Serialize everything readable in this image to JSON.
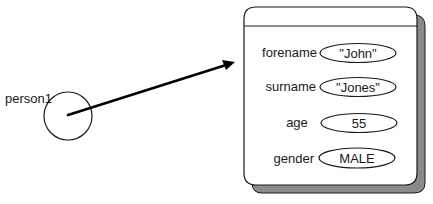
{
  "diagram": {
    "reference": {
      "label": "person1"
    },
    "object": {
      "fields": [
        {
          "name": "forename",
          "value": "\"John\""
        },
        {
          "name": "surname",
          "value": "\"Jones\""
        },
        {
          "name": "age",
          "value": "55"
        },
        {
          "name": "gender",
          "value": "MALE"
        }
      ]
    },
    "colors": {
      "stroke": "#1a1a1a",
      "shadow": "#8a8a8a",
      "background": "#ffffff"
    }
  }
}
